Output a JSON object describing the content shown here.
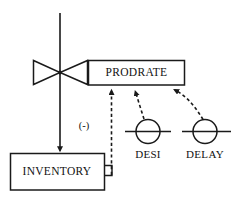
{
  "diagram": {
    "type": "system-dynamics-flow-diagram",
    "title": "",
    "background_color": "#ffffff",
    "line_color": "#1a1a1a",
    "text_color": "#111111",
    "nodes": [
      {
        "id": "prodrate",
        "label": "PRODRATE",
        "shape": "rectangle",
        "role": "rate",
        "x": 88,
        "y": 60,
        "width": 97,
        "height": 25
      },
      {
        "id": "inventory",
        "label": "INVENTORY",
        "shape": "rectangle",
        "role": "level",
        "x": 10,
        "y": 153,
        "width": 95,
        "height": 37
      },
      {
        "id": "desi",
        "label": "DESI",
        "shape": "circle",
        "role": "auxiliary",
        "cx": 148,
        "cy": 131,
        "r": 12
      },
      {
        "id": "delay",
        "label": "DELAY",
        "shape": "circle",
        "role": "auxiliary",
        "cx": 205,
        "cy": 131,
        "r": 12
      },
      {
        "id": "valve",
        "label": "",
        "shape": "bowtie-valve",
        "role": "valve",
        "cx": 60,
        "cy": 72
      }
    ],
    "links": [
      {
        "id": "flow-to-inventory",
        "from": "source-cloud",
        "to": "inventory",
        "style": "solid",
        "arrow": true,
        "polarity": ""
      },
      {
        "id": "inventory-to-prodrate",
        "from": "inventory",
        "to": "prodrate",
        "style": "dashed",
        "arrow": true,
        "polarity": "(-)"
      },
      {
        "id": "desi-to-prodrate",
        "from": "desi",
        "to": "prodrate",
        "style": "dashed",
        "arrow": true,
        "polarity": ""
      },
      {
        "id": "delay-to-prodrate",
        "from": "delay",
        "to": "prodrate",
        "style": "dashed",
        "arrow": true,
        "polarity": ""
      }
    ],
    "annotations": [
      {
        "id": "polarity-negative",
        "text": "(-)",
        "x": 84,
        "y": 127
      }
    ]
  }
}
